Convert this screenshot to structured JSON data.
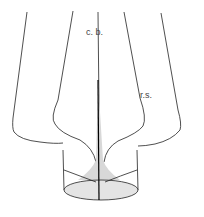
{
  "diagram": {
    "type": "fashion pattern technical drawing (skirt with center-back pleat / godet)",
    "labels": {
      "center_back": "c. b.",
      "right_side": "r.s."
    },
    "colors": {
      "line": "#222222",
      "fill": "#ffffff",
      "shade": "#d8d8d8",
      "background": "#ffffff"
    }
  }
}
